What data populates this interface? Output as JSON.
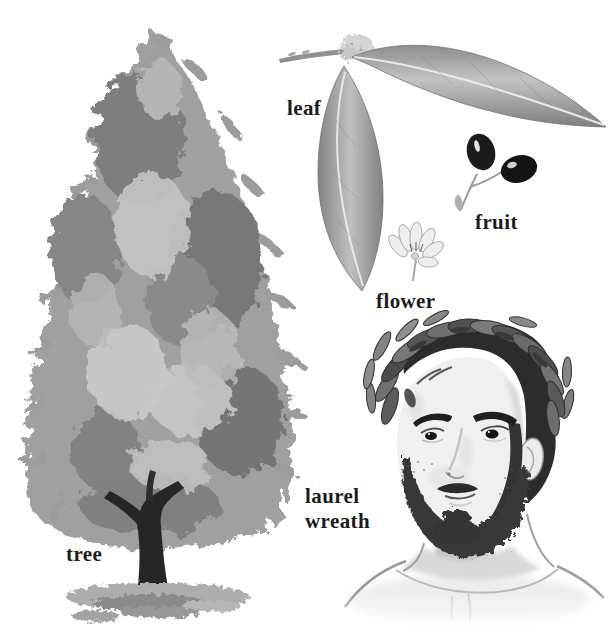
{
  "figure": {
    "subject": "laurel",
    "background": "#ffffff",
    "label_color": "#1c1c1c",
    "labels": {
      "tree": "tree",
      "leaf": "leaf",
      "fruit": "fruit",
      "flower": "flower",
      "laurel_wreath_line1": "laurel",
      "laurel_wreath_line2": "wreath"
    },
    "illustrations": [
      {
        "icon": "laurel-tree-illustration",
        "caption": "tree"
      },
      {
        "icon": "laurel-branch-leaves-illustration",
        "caption": "leaf"
      },
      {
        "icon": "laurel-berries-illustration",
        "caption": "fruit"
      },
      {
        "icon": "laurel-flower-illustration",
        "caption": "flower"
      },
      {
        "icon": "laurel-wreath-portrait-illustration",
        "caption": "laurel wreath"
      }
    ],
    "palette": {
      "ink": "#1c1c1c",
      "foliage_light": "#c6c6c6",
      "foliage_mid": "#9b9b9b",
      "foliage_dark": "#787878",
      "trunk": "#262626",
      "berry": "#161616",
      "skin": "#f0f0f0",
      "hair": "#2c2c2c"
    }
  }
}
